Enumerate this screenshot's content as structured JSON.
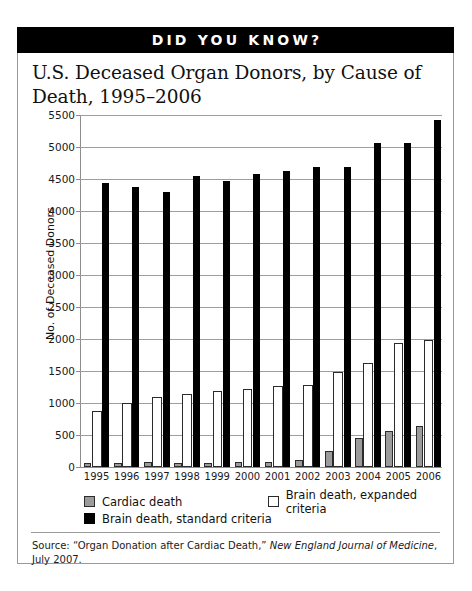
{
  "banner": {
    "label": "DID YOU KNOW?"
  },
  "source": {
    "prefix": "Source: “Organ Donation after Cardiac Death,” ",
    "journal": "New England Journal of Medicine",
    "suffix": ", July 2007."
  },
  "colors": {
    "cardiac": "#9b9b9b",
    "expanded": "#ffffff",
    "standard": "#000000",
    "banner_bg": "#000000",
    "banner_text": "#ffffff",
    "grid": "#9d9d9d",
    "border": "#9a9a9a"
  },
  "chart_data": {
    "type": "bar",
    "title": "U.S. Deceased Organ Donors, by Cause of Death, 1995–2006",
    "xlabel": "",
    "ylabel": "No. of Deceased Donors",
    "ylim": [
      0,
      5500
    ],
    "yticks": [
      0,
      500,
      1000,
      1500,
      2000,
      2500,
      3000,
      3500,
      4000,
      4500,
      5000,
      5500
    ],
    "ytick_labels": [
      "0",
      "500",
      "1000",
      "1500",
      "2000",
      "2500",
      "3000",
      "3500",
      "4000",
      "4500",
      "5000",
      "5500"
    ],
    "grid": true,
    "legend_position": "below-axis",
    "categories": [
      "1995",
      "1996",
      "1997",
      "1998",
      "1999",
      "2000",
      "2001",
      "2002",
      "2003",
      "2004",
      "2005",
      "2006"
    ],
    "series": [
      {
        "name": "Cardiac death",
        "color": "#9b9b9b",
        "values": [
          60,
          65,
          75,
          70,
          60,
          85,
          80,
          110,
          245,
          450,
          560,
          635
        ]
      },
      {
        "name": "Brain death, expanded criteria",
        "color": "#ffffff",
        "values": [
          880,
          1000,
          1090,
          1140,
          1180,
          1215,
          1270,
          1280,
          1490,
          1620,
          1930,
          1990
        ]
      },
      {
        "name": "Brain death, standard criteria",
        "color": "#000000",
        "values": [
          4430,
          4380,
          4290,
          4550,
          4470,
          4580,
          4620,
          4690,
          4690,
          5060,
          5060,
          5420
        ]
      }
    ]
  }
}
